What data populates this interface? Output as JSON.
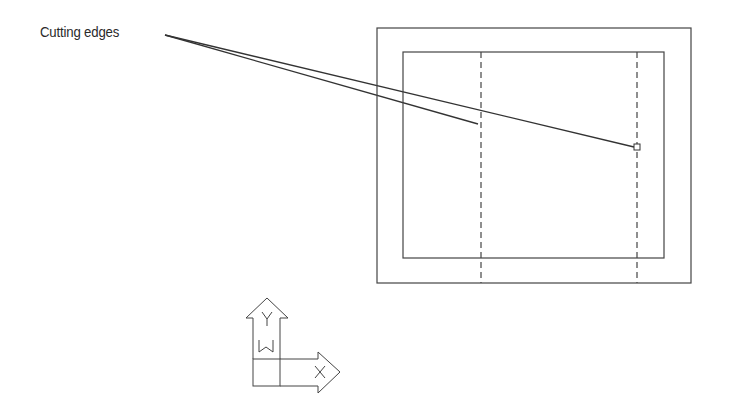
{
  "annotation": {
    "label": "Cutting edges"
  },
  "drawing": {
    "outer_rect": {
      "x": 377,
      "y": 28,
      "w": 314,
      "h": 255
    },
    "inner_rect": {
      "x": 403,
      "y": 52,
      "w": 261,
      "h": 206
    },
    "cutting_edges": [
      {
        "x": 481,
        "y1": 52,
        "y2": 283,
        "style": "dashed"
      },
      {
        "x": 637,
        "y1": 52,
        "y2": 283,
        "style": "dashed"
      }
    ],
    "leader_lines": [
      {
        "x1": 165,
        "y1": 35,
        "x2": 478,
        "y2": 124
      },
      {
        "x1": 165,
        "y1": 35,
        "x2": 634,
        "y2": 147
      }
    ],
    "pickbox": {
      "x": 634,
      "y": 144,
      "size": 6
    }
  },
  "ucs_icon": {
    "y_label": "Y",
    "w_label": "W",
    "x_label": "X"
  },
  "colors": {
    "line": "#333333",
    "background": "#ffffff"
  }
}
